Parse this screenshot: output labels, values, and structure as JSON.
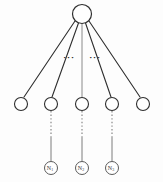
{
  "diagram": {
    "background_color": "#fdfdfd",
    "stroke_color": "#2e2e2e",
    "light_stroke_color": "#8a8a8a",
    "root": {
      "name": "root-node",
      "label": "",
      "cx": 82,
      "cy": 14,
      "r": 9.5
    },
    "level1_nodes": [
      {
        "name": "level1-node-1",
        "label": "",
        "cx": 21,
        "cy": 104,
        "r": 6.5
      },
      {
        "name": "level1-node-2",
        "label": "",
        "cx": 51,
        "cy": 104,
        "r": 6.5
      },
      {
        "name": "level1-node-3",
        "label": "",
        "cx": 82,
        "cy": 104,
        "r": 6.5
      },
      {
        "name": "level1-node-4",
        "label": "",
        "cx": 112,
        "cy": 104,
        "r": 6.5
      },
      {
        "name": "level1-node-5",
        "label": "",
        "cx": 143,
        "cy": 104,
        "r": 6.5
      }
    ],
    "leaf_nodes": [
      {
        "name": "leaf-node-n1",
        "label": "N",
        "subscript": "1",
        "cx": 51,
        "cy": 168,
        "r": 6.5
      },
      {
        "name": "leaf-node-n2",
        "label": "N",
        "subscript": "2",
        "cx": 82,
        "cy": 168,
        "r": 6.5
      },
      {
        "name": "leaf-node-n3",
        "label": "N",
        "subscript": "3",
        "cx": 112,
        "cy": 168,
        "r": 6.5
      }
    ],
    "root_edges": [
      {
        "name": "edge-root-to-node1",
        "x1": 75,
        "y1": 21,
        "x2": 24,
        "y2": 97
      },
      {
        "name": "edge-root-to-node2",
        "x1": 78.5,
        "y1": 23,
        "x2": 52,
        "y2": 97
      },
      {
        "name": "edge-root-to-node3",
        "x1": 82,
        "y1": 23.5,
        "x2": 82,
        "y2": 97,
        "light": true
      },
      {
        "name": "edge-root-to-node4",
        "x1": 85.5,
        "y1": 23,
        "x2": 111,
        "y2": 97
      },
      {
        "name": "edge-root-to-node5",
        "x1": 89,
        "y1": 21,
        "x2": 140,
        "y2": 97
      }
    ],
    "vertical_connectors": [
      {
        "name": "connector-node2-to-n1",
        "x": 51,
        "dashed_y1": 111,
        "dashed_y2": 137,
        "solid_y1": 137,
        "solid_y2": 161
      },
      {
        "name": "connector-node3-to-n2",
        "x": 82,
        "dashed_y1": 111,
        "dashed_y2": 137,
        "solid_y1": 137,
        "solid_y2": 161
      },
      {
        "name": "connector-node4-to-n3",
        "x": 112,
        "dashed_y1": 111,
        "dashed_y2": 137,
        "solid_y1": 137,
        "solid_y2": 161
      }
    ],
    "ellipses": [
      {
        "name": "ellipsis-left",
        "text": "···",
        "x": 69,
        "y": 60
      },
      {
        "name": "ellipsis-right",
        "text": "···",
        "x": 95,
        "y": 60
      }
    ]
  }
}
